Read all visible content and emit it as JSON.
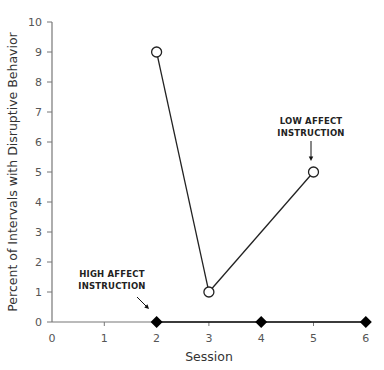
{
  "chart_data": {
    "type": "line",
    "title": "",
    "xlabel": "Session",
    "ylabel": "Percent of Intervals with Disruptive Behavior",
    "xlim": [
      0,
      6
    ],
    "ylim": [
      0,
      10
    ],
    "x_ticks": [
      "0",
      "1",
      "2",
      "3",
      "4",
      "5",
      "6"
    ],
    "y_ticks": [
      "0",
      "1",
      "2",
      "3",
      "4",
      "5",
      "6",
      "7",
      "8",
      "9",
      "10"
    ],
    "grid": false,
    "legend": null,
    "series": [
      {
        "name": "Low affect instruction",
        "marker": "open-circle",
        "x": [
          2,
          3,
          5
        ],
        "values": [
          9,
          1,
          5
        ]
      },
      {
        "name": "High affect instruction",
        "marker": "filled-diamond",
        "x": [
          2,
          4,
          6
        ],
        "values": [
          0,
          0,
          0
        ]
      }
    ],
    "annotations": [
      {
        "text_line1": "HIGH AFFECT",
        "text_line2": "INSTRUCTION",
        "points_to": {
          "x": 2,
          "y": 0
        }
      },
      {
        "text_line1": "LOW AFFECT",
        "text_line2": "INSTRUCTION",
        "points_to": {
          "x": 5,
          "y": 5
        }
      }
    ]
  }
}
